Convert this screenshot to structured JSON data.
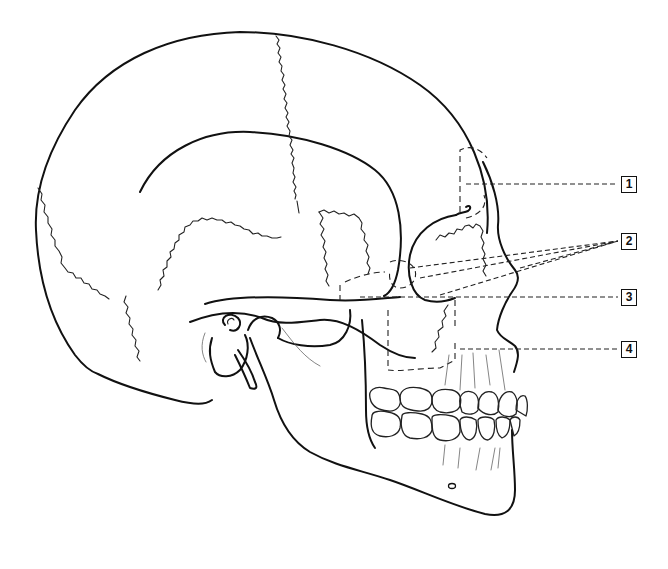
{
  "diagram": {
    "type": "anatomical line drawing",
    "view": "lateral (right side, facing right)",
    "style": "black ink line art, dashed outlines for hidden structures",
    "colors": {
      "line": "#111111",
      "background": "#ffffff"
    },
    "labels": [
      {
        "id": "1",
        "text": "1",
        "x": 621,
        "y": 177
      },
      {
        "id": "2",
        "text": "2",
        "x": 621,
        "y": 234
      },
      {
        "id": "3",
        "text": "3",
        "x": 621,
        "y": 290
      },
      {
        "id": "4",
        "text": "4",
        "x": 621,
        "y": 342
      }
    ]
  }
}
